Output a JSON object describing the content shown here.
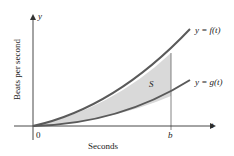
{
  "figure": {
    "y_axis_symbol": "y",
    "t_axis_symbol": "t",
    "ylabel": "Beats per second",
    "xlabel": "Seconds",
    "origin_label": "0",
    "b_label": "b",
    "region_label": "S",
    "curve_f_label": "y = f(t)",
    "curve_g_label": "y = g(t)",
    "colors": {
      "curve": "#5a5a5a",
      "shade": "#d9d9d9",
      "axis": "#333333"
    }
  }
}
